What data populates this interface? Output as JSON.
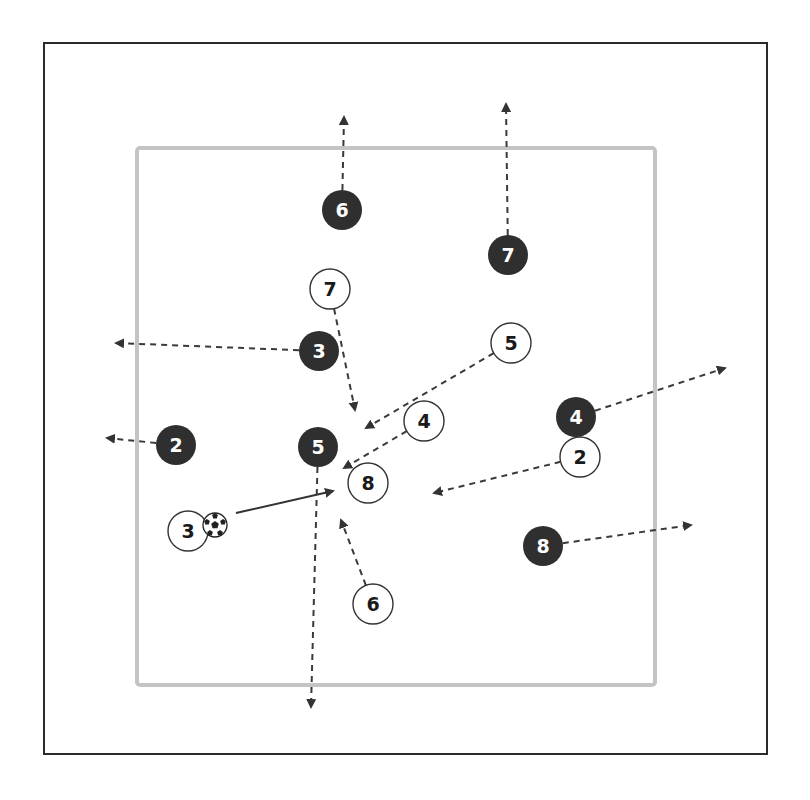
{
  "diagram": {
    "type": "soccer-drill",
    "outer_frame": {
      "x": 44,
      "y": 43,
      "w": 723,
      "h": 711,
      "color": "#2b2b2b"
    },
    "inner_square": {
      "x": 137,
      "y": 148,
      "w": 518,
      "h": 537,
      "color": "#c4c4c4"
    },
    "colors": {
      "dark_team_fill": "#2f2f2f",
      "dark_team_text": "#ffffff",
      "light_team_fill": "#ffffff",
      "light_team_text": "#1a1a1a",
      "run_line": "#3a3a3a",
      "pass_line": "#333333"
    },
    "ball": {
      "icon": "soccer-ball-icon",
      "x": 215,
      "y": 525,
      "r": 12
    },
    "dark_team": [
      {
        "number": "6",
        "x": 342,
        "y": 210,
        "run_to": [
          344,
          117
        ]
      },
      {
        "number": "7",
        "x": 508,
        "y": 255,
        "run_to": [
          506,
          104
        ]
      },
      {
        "number": "3",
        "x": 319,
        "y": 351,
        "run_to": [
          116,
          343
        ]
      },
      {
        "number": "2",
        "x": 176,
        "y": 445,
        "run_to": [
          107,
          438
        ]
      },
      {
        "number": "5",
        "x": 318,
        "y": 447,
        "run_to": [
          311,
          707
        ]
      },
      {
        "number": "4",
        "x": 576,
        "y": 417,
        "run_to": [
          725,
          368
        ]
      },
      {
        "number": "8",
        "x": 543,
        "y": 546,
        "run_to": [
          691,
          525
        ]
      }
    ],
    "light_team": [
      {
        "number": "7",
        "x": 330,
        "y": 289,
        "run_to": [
          355,
          410
        ]
      },
      {
        "number": "5",
        "x": 511,
        "y": 343,
        "run_to": [
          366,
          428
        ]
      },
      {
        "number": "4",
        "x": 424,
        "y": 421,
        "run_to": [
          344,
          468
        ]
      },
      {
        "number": "2",
        "x": 580,
        "y": 457,
        "run_to": [
          434,
          493
        ]
      },
      {
        "number": "8",
        "x": 368,
        "y": 483,
        "run_to": null
      },
      {
        "number": "3",
        "x": 188,
        "y": 531,
        "run_to": null
      },
      {
        "number": "6",
        "x": 373,
        "y": 604,
        "run_to": [
          341,
          520
        ]
      }
    ],
    "pass": {
      "from": [
        236,
        513
      ],
      "to": [
        333,
        491
      ],
      "label": "pass-arrow"
    }
  }
}
